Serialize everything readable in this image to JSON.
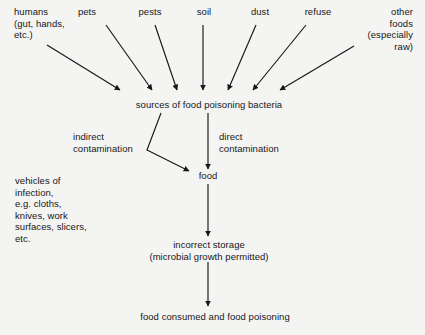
{
  "diagram": {
    "background_color": "#f4f4f3",
    "ink_color": "#171717",
    "sources": [
      {
        "id": "humans",
        "label": "humans\n(gut, hands,\netc.)"
      },
      {
        "id": "pets",
        "label": "pets"
      },
      {
        "id": "pests",
        "label": "pests"
      },
      {
        "id": "soil",
        "label": "soil"
      },
      {
        "id": "dust",
        "label": "dust"
      },
      {
        "id": "refuse",
        "label": "refuse"
      },
      {
        "id": "other-foods",
        "label": "other\nfoods\n(especially\nraw)"
      }
    ],
    "nodes": {
      "sources_hub": "sources of food poisoning bacteria",
      "food": "food",
      "incorrect_storage": "incorrect storage\n(microbial growth permitted)",
      "outcome": "food consumed and food poisoning",
      "vehicles": "vehicles of\ninfection,\ne.g. cloths,\nknives, work\nsurfaces, slicers,\netc."
    },
    "edge_labels": {
      "indirect": "indirect\ncontamination",
      "direct": "direct\ncontamination"
    }
  }
}
